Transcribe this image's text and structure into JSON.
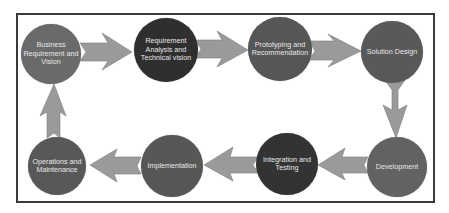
{
  "diagram": {
    "type": "process-cycle",
    "colors": {
      "frame": "#3a3a3a",
      "arrow": "#9a9a9a",
      "arrow_edge": "#7a7a7a",
      "text": "#e8e8e8"
    },
    "nodes": [
      {
        "id": "business",
        "label": "Business Requirement and Vision",
        "color": "#6a6a6a"
      },
      {
        "id": "requirement",
        "label": "Requirement Analysis and Technical vision",
        "color": "#2f2f2f"
      },
      {
        "id": "prototyping",
        "label": "Prototyping and Recommendation",
        "color": "#565656"
      },
      {
        "id": "solution",
        "label": "Solution Design",
        "color": "#595959"
      },
      {
        "id": "development",
        "label": "Development",
        "color": "#626262"
      },
      {
        "id": "integration",
        "label": "Integration and Testing",
        "color": "#333333"
      },
      {
        "id": "implementation",
        "label": "Implementation",
        "color": "#575757"
      },
      {
        "id": "operations",
        "label": "Operations and Maintenance",
        "color": "#585858"
      }
    ],
    "flow": [
      [
        "business",
        "requirement"
      ],
      [
        "requirement",
        "prototyping"
      ],
      [
        "prototyping",
        "solution"
      ],
      [
        "solution",
        "development"
      ],
      [
        "development",
        "integration"
      ],
      [
        "integration",
        "implementation"
      ],
      [
        "implementation",
        "operations"
      ],
      [
        "operations",
        "business"
      ]
    ]
  }
}
